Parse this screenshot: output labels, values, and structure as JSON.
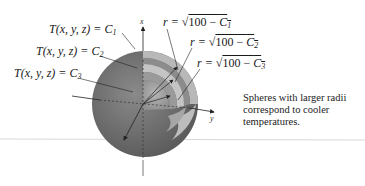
{
  "figure": {
    "type": "nested-spheres-level-surfaces",
    "axes": {
      "vertical": "x",
      "horizontal": "y"
    },
    "left_labels": [
      {
        "lhs": "T(x, y, z) = ",
        "constant": "C",
        "subscript": "1"
      },
      {
        "lhs": "T(x, y, z) = ",
        "constant": "C",
        "subscript": "2"
      },
      {
        "lhs": "T(x, y, z) = ",
        "constant": "C",
        "subscript": "3"
      }
    ],
    "right_labels": [
      {
        "lhs": "r = ",
        "radical": "√",
        "radicand": "100 − ",
        "constant": "C",
        "subscript": "1"
      },
      {
        "lhs": "r = ",
        "radical": "√",
        "radicand": "100 − ",
        "constant": "C",
        "subscript": "2"
      },
      {
        "lhs": "r = ",
        "radical": "√",
        "radicand": "100 − ",
        "constant": "C",
        "subscript": "3"
      }
    ],
    "caption_lines": [
      "Spheres with larger radii",
      "correspond to cooler",
      "temperatures."
    ],
    "colors": {
      "outer_sphere": "#6b6b6b",
      "middle_shell": "#8e8e8e",
      "inner_shell": "#a9a9a9",
      "cutaway_highlight": "#c8c8c8",
      "divider": "#d8d8d8"
    }
  }
}
